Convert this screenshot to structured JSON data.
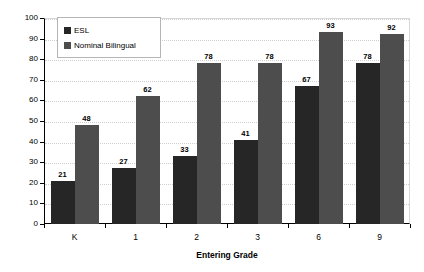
{
  "chart_data": {
    "type": "bar",
    "title": "",
    "xlabel": "Entering Grade",
    "ylabel": "% Still LEP after 3 Years",
    "categories": [
      "K",
      "1",
      "2",
      "3",
      "6",
      "9"
    ],
    "series": [
      {
        "name": "ESL",
        "color": "#262626",
        "values": [
          21,
          27,
          33,
          41,
          67,
          78
        ]
      },
      {
        "name": "Nominal Bilingual",
        "color": "#4d4d4d",
        "values": [
          48,
          62,
          78,
          78,
          93,
          92
        ]
      }
    ],
    "ylim": [
      0,
      100
    ],
    "ytick_labels": [
      "0",
      "10",
      "20",
      "30",
      "40",
      "50",
      "60",
      "70",
      "80",
      "90",
      "100"
    ],
    "ytick_values": [
      0,
      10,
      20,
      30,
      40,
      50,
      60,
      70,
      80,
      90,
      100
    ],
    "grid": true,
    "grid_axis": "y",
    "legend_position": "top-left",
    "data_labels": true
  }
}
